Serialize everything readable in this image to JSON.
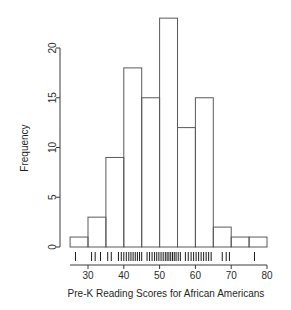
{
  "chart_data": {
    "type": "bar",
    "title": "",
    "xlabel": "Pre-K Reading Scores for African Americans",
    "ylabel": "Frequency",
    "bin_width": 5,
    "bin_edges": [
      25,
      30,
      35,
      40,
      45,
      50,
      55,
      60,
      65,
      70,
      75,
      80
    ],
    "categories": [
      "25-30",
      "30-35",
      "35-40",
      "40-45",
      "45-50",
      "50-55",
      "55-60",
      "60-65",
      "65-70",
      "70-75",
      "75-80"
    ],
    "values": [
      1,
      3,
      9,
      18,
      15,
      23,
      12,
      15,
      2,
      1,
      1
    ],
    "xlim": [
      25,
      80
    ],
    "ylim": [
      0,
      23
    ],
    "x_ticks": [
      30,
      40,
      50,
      60,
      70,
      80
    ],
    "x_tick_labels": [
      "30",
      "40",
      "50",
      "60",
      "70",
      "80"
    ],
    "y_ticks": [
      0,
      5,
      10,
      15,
      20
    ],
    "y_tick_labels": [
      "0",
      "5",
      "10",
      "15",
      "20"
    ],
    "grid": false,
    "legend": "none",
    "rug": true,
    "rug_values": [
      26.5,
      31.0,
      32.0,
      33.5,
      35.5,
      36.5,
      38.5,
      39.3,
      40.0,
      40.7,
      41.4,
      42.0,
      42.6,
      43.2,
      43.8,
      44.4,
      45.0,
      46.5,
      47.2,
      47.9,
      48.6,
      49.2,
      49.8,
      50.4,
      51.0,
      51.6,
      52.1,
      52.6,
      53.1,
      53.6,
      54.1,
      54.6,
      55.2,
      55.8,
      57.2,
      58.0,
      58.8,
      59.5,
      60.2,
      60.9,
      61.6,
      62.3,
      63.0,
      63.7,
      64.4,
      67.5,
      68.6,
      69.5,
      76.5
    ]
  },
  "colors": {
    "bar_stroke": "#5a5a5a",
    "axis": "#3a3a3a",
    "text": "#1f1f1f",
    "rug": "#1a1a1a",
    "background": "#ffffff"
  },
  "labels": {
    "y_axis_title": "Frequency",
    "x_axis_title": "Pre-K Reading Scores for African Americans"
  }
}
